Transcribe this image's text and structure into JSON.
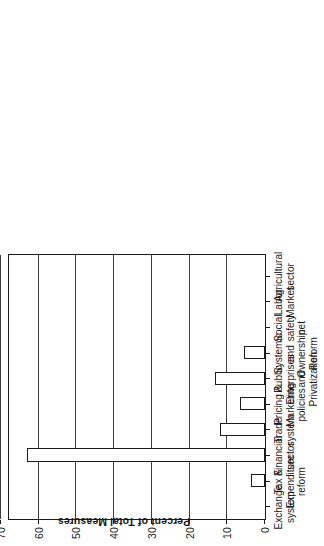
{
  "chart_data": {
    "type": "bar",
    "title": "",
    "subtitle": "",
    "orientation": "vertical-bars-rotated-90ccw",
    "xlabel": "",
    "ylabel": "Percent of Total Measures",
    "ylim": [
      0,
      70
    ],
    "ytick_values": [
      0,
      10,
      20,
      30,
      40,
      50,
      60,
      70
    ],
    "ytick_labels": [
      "0",
      "10",
      "20",
      "30",
      "40",
      "50",
      "60",
      "70"
    ],
    "grid": true,
    "grid_axis": "y",
    "legend": null,
    "legend_position": "none",
    "bar_fill_color": "#ffffff",
    "bar_edge_color": "#1a1a1a",
    "axis_color": "#1a1a1a",
    "categories": [
      "Exchange\nsystem",
      "Tax &\nExpenditure\nreform",
      "Financial\nsector",
      "Trade\nsystem",
      "Pricing &\nMarketing\npolicies",
      "Public\nEnterprises\nand\nPrivatization",
      "Systemic\nand\nOwnership\nReform",
      "Social\nsafety\nnet",
      "Labor\nMarket",
      "Agricultural\nsector"
    ],
    "values": [
      0,
      3.6,
      63,
      12,
      6.6,
      13.3,
      5.6,
      0,
      0,
      0
    ]
  },
  "axes": {
    "value_axis_title": "Percent of Total Measures"
  }
}
